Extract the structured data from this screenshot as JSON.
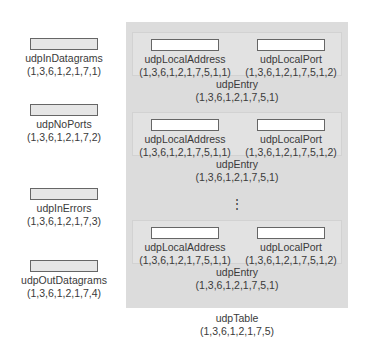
{
  "scalars": [
    {
      "name": "udpInDatagrams",
      "oid": "(1,3,6,1,2,1,7,1)"
    },
    {
      "name": "udpNoPorts",
      "oid": "(1,3,6,1,2,1,7,2)"
    },
    {
      "name": "udpInErrors",
      "oid": "(1,3,6,1,2,1,7,3)"
    },
    {
      "name": "udpOutDatagrams",
      "oid": "(1,3,6,1,2,1,7,4)"
    }
  ],
  "table": {
    "name": "udpTable",
    "oid": "(1,3,6,1,2,1,7,5)",
    "entries": [
      {
        "name": "udpEntry",
        "oid": "(1,3,6,1,2,1,7,5,1)",
        "columns": [
          {
            "name": "udpLocalAddress",
            "oid": "(1,3,6,1,2,1,7,5,1,1)"
          },
          {
            "name": "udpLocalPort",
            "oid": "(1,3,6,1,2,1,7,5,1,2)"
          }
        ]
      },
      {
        "name": "udpEntry",
        "oid": "(1,3,6,1,2,1,7,5,1)",
        "columns": [
          {
            "name": "udpLocalAddress",
            "oid": "(1,3,6,1,2,1,7,5,1,1)"
          },
          {
            "name": "udpLocalPort",
            "oid": "(1,3,6,1,2,1,7,5,1,2)"
          }
        ]
      },
      {
        "name": "udpEntry",
        "oid": "(1,3,6,1,2,1,7,5,1)",
        "columns": [
          {
            "name": "udpLocalAddress",
            "oid": "(1,3,6,1,2,1,7,5,1,1)"
          },
          {
            "name": "udpLocalPort",
            "oid": "(1,3,6,1,2,1,7,5,1,2)"
          }
        ]
      }
    ],
    "ellipsis": "⋮"
  },
  "colors": {
    "panel": "#dcdcdc",
    "entry": "#e2e2e2",
    "scalar_box": "#e6e6e6",
    "column_box": "#ffffff",
    "text": "#3a3a3a"
  }
}
